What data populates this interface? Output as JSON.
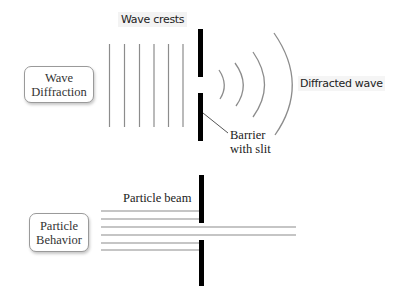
{
  "diagram": {
    "wave_section": {
      "box_label_line1": "Wave",
      "box_label_line2": "Diffraction",
      "crests_label": "Wave crests",
      "diffracted_label": "Diffracted wave",
      "barrier_label_line1": "Barrier",
      "barrier_label_line2": "with slit",
      "crest_line_count": 6,
      "diffracted_arc_count": 4
    },
    "particle_section": {
      "box_label_line1": "Particle",
      "box_label_line2": "Behavior",
      "beam_label": "Particle beam",
      "beam_line_count": 6,
      "lines_passing_through_slit": 2
    },
    "colors": {
      "line_gray": "#8c8c8c",
      "barrier_black": "#000000",
      "text": "#222222"
    }
  }
}
